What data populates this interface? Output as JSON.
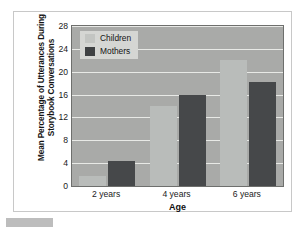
{
  "chart_data": {
    "type": "bar",
    "title": "",
    "xlabel": "Age",
    "ylabel": "Mean Percentage of Utterances During Storybook Conversations",
    "categories": [
      "2 years",
      "4 years",
      "6 years"
    ],
    "series": [
      {
        "name": "Children",
        "color": "#b9bcba",
        "values": [
          1.7,
          14.0,
          22.0
        ]
      },
      {
        "name": "Mothers",
        "color": "#46484a",
        "values": [
          4.3,
          16.0,
          18.2
        ]
      }
    ],
    "ylim": [
      0,
      28
    ],
    "yticks": [
      0,
      4,
      8,
      12,
      16,
      20,
      24,
      28
    ],
    "grid": true,
    "legend_position": "top-left",
    "plot_background": "#a9aaa8",
    "gridline_color": "#e8e9e6"
  },
  "legend": {
    "items": [
      {
        "label": "Children"
      },
      {
        "label": "Mothers"
      }
    ]
  }
}
